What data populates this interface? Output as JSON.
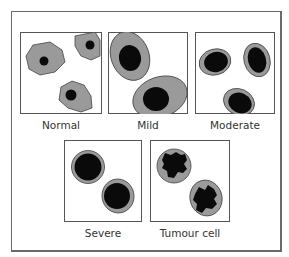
{
  "colors": {
    "cytoplasm": "#9a9a9a",
    "nucleus": "#0a0a0a",
    "outline": "#444444",
    "frame": "#6a6a6a"
  },
  "panels": [
    {
      "id": "normal",
      "label": "Normal"
    },
    {
      "id": "mild",
      "label": "Mild"
    },
    {
      "id": "moderate",
      "label": "Moderate"
    },
    {
      "id": "severe",
      "label": "Severe"
    },
    {
      "id": "tumour",
      "label": "Tumour cell"
    }
  ]
}
